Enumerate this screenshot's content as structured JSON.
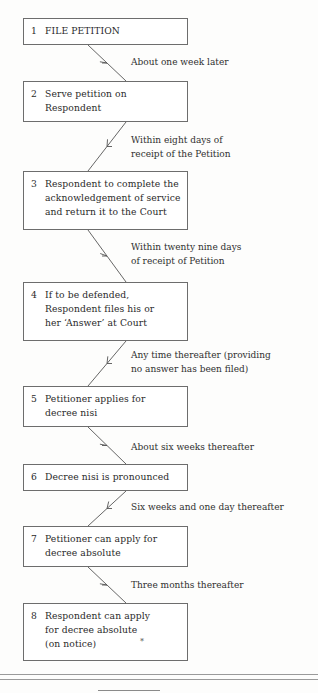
{
  "diagram": {
    "steps": [
      {
        "num": "1",
        "text": "FILE PETITION"
      },
      {
        "num": "2",
        "text": "Serve petition on\nRespondent"
      },
      {
        "num": "3",
        "text": "Respondent to complete the\nacknowledgement of service\nand return it to the Court"
      },
      {
        "num": "4",
        "text": "If to be defended,\nRespondent files his or\nher ‘Answer’ at Court"
      },
      {
        "num": "5",
        "text": "Petitioner applies for\ndecree nisi"
      },
      {
        "num": "6",
        "text": "Decree nisi is pronounced"
      },
      {
        "num": "7",
        "text": "Petitioner can apply for\ndecree absolute"
      },
      {
        "num": "8",
        "text": "Respondent can apply\nfor decree absolute\n(on notice)"
      }
    ],
    "intervals": [
      "About one week later",
      "Within eight days of\nreceipt of the Petition",
      "Within twenty nine days\nof receipt of Petition",
      "Any time thereafter (providing\nno answer has been filed)",
      "About six weeks thereafter",
      "Six weeks and one day thereafter",
      "Three months thereafter"
    ],
    "footnote_marker": "*"
  }
}
